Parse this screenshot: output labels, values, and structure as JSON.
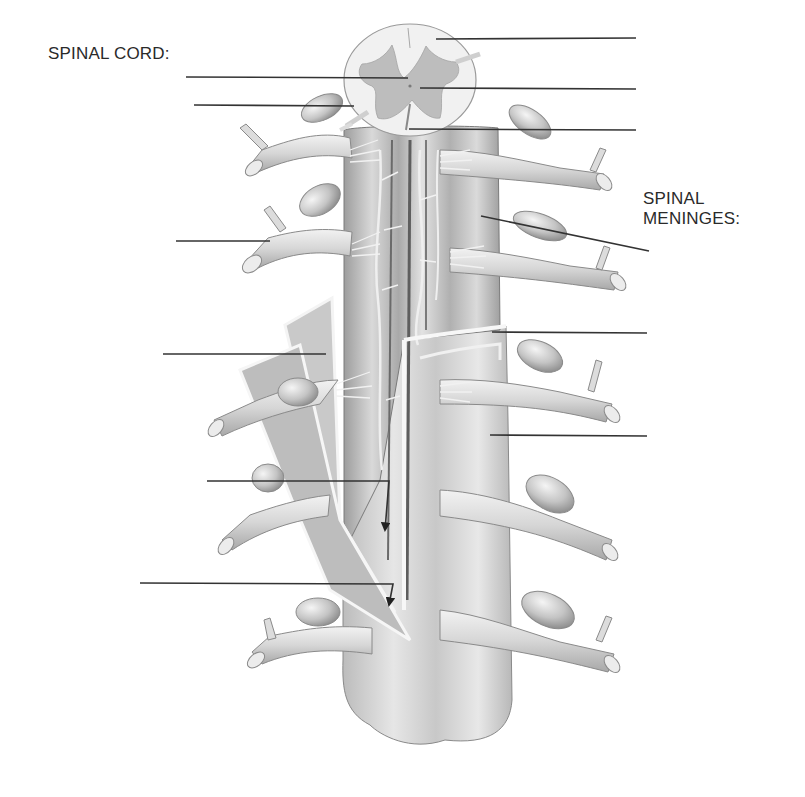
{
  "diagram": {
    "headings": {
      "spinal_cord": "SPINAL CORD:",
      "spinal_meninges_line1": "SPINAL",
      "spinal_meninges_line2": "MENINGES:"
    },
    "colors": {
      "background": "#ffffff",
      "text": "#2a2a2a",
      "leader_line": "#333333",
      "white_matter": "#f1f1f1",
      "gray_matter": "#bdbdbd",
      "cord_body": "#cfcfcf",
      "cord_shadow": "#9a9a9a",
      "nerve": "#dcdcdc",
      "membrane_edge": "#f7f7f7",
      "outline": "#7a7a7a"
    },
    "leader_lines": [
      {
        "id": "cord-1",
        "group": "spinal_cord",
        "x1": 436,
        "y1": 39,
        "x2": 636,
        "y2": 38,
        "arrow": false,
        "answer": ""
      },
      {
        "id": "cord-2",
        "group": "spinal_cord",
        "x1": 186,
        "y1": 77,
        "x2": 408,
        "y2": 78,
        "arrow": false,
        "answer": ""
      },
      {
        "id": "cord-3",
        "group": "spinal_cord",
        "x1": 420,
        "y1": 88,
        "x2": 636,
        "y2": 89,
        "arrow": false,
        "answer": ""
      },
      {
        "id": "cord-4",
        "group": "spinal_cord",
        "x1": 194,
        "y1": 105,
        "x2": 354,
        "y2": 106,
        "arrow": false,
        "answer": ""
      },
      {
        "id": "cord-5",
        "group": "spinal_cord",
        "x1": 409,
        "y1": 129,
        "x2": 636,
        "y2": 130,
        "arrow": false,
        "answer": ""
      },
      {
        "id": "left-6",
        "group": "unlabeled",
        "x1": 176,
        "y1": 241,
        "x2": 270,
        "y2": 241,
        "arrow": false,
        "answer": ""
      },
      {
        "id": "men-1",
        "group": "spinal_meninges",
        "x1": 481,
        "y1": 216,
        "x2": 649,
        "y2": 251,
        "arrow": false,
        "answer": ""
      },
      {
        "id": "left-7",
        "group": "unlabeled",
        "x1": 163,
        "y1": 354,
        "x2": 326,
        "y2": 354,
        "arrow": false,
        "answer": ""
      },
      {
        "id": "men-2",
        "group": "spinal_meninges",
        "x1": 492,
        "y1": 332,
        "x2": 647,
        "y2": 333,
        "arrow": false,
        "answer": ""
      },
      {
        "id": "men-3",
        "group": "spinal_meninges",
        "x1": 490,
        "y1": 435,
        "x2": 647,
        "y2": 436,
        "arrow": false,
        "answer": ""
      },
      {
        "id": "left-8",
        "group": "unlabeled",
        "x1": 207,
        "y1": 481,
        "x2": 389,
        "y2": 481,
        "arrow": true,
        "arrow_to_x": 384,
        "arrow_to_y": 531,
        "answer": ""
      },
      {
        "id": "left-9",
        "group": "unlabeled",
        "x1": 140,
        "y1": 583,
        "x2": 393,
        "y2": 584,
        "arrow": true,
        "arrow_to_x": 389,
        "arrow_to_y": 606,
        "answer": ""
      }
    ]
  }
}
